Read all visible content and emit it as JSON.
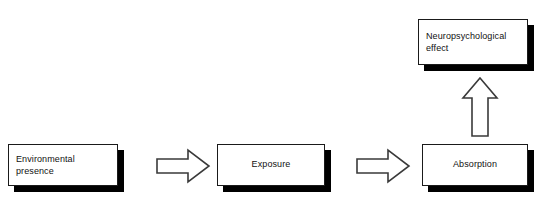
{
  "diagram": {
    "background_color": "#ffffff",
    "box_fill_color": "#ffffff",
    "box_border_color": "#1a1a1a",
    "box_shadow_color": "#000000",
    "arrow_fill_color": "#ffffff",
    "arrow_stroke_color": "#3a3a3a",
    "text_color": "#111111",
    "nodes": [
      {
        "id": "environmental-presence",
        "label": "Environmental\npresence",
        "line1": "Environmental",
        "line2": "presence",
        "align": "left"
      },
      {
        "id": "exposure",
        "label": "Exposure",
        "line1": "Exposure",
        "align": "center"
      },
      {
        "id": "absorption",
        "label": "Absorption",
        "line1": "Absorption",
        "align": "center"
      },
      {
        "id": "neuropsychological-effect",
        "label": "Neuropsychological\neffect",
        "line1": "Neuropsychological",
        "line2": "effect",
        "align": "left"
      }
    ],
    "connectors": [
      {
        "id": "arrow-presence-to-exposure",
        "icon": "arrow-right-block-icon",
        "direction": "right",
        "from": "environmental-presence",
        "to": "exposure"
      },
      {
        "id": "arrow-exposure-to-absorption",
        "icon": "arrow-right-block-icon",
        "direction": "right",
        "from": "exposure",
        "to": "absorption"
      },
      {
        "id": "arrow-absorption-to-effect",
        "icon": "arrow-up-block-icon",
        "direction": "up",
        "from": "absorption",
        "to": "neuropsychological-effect"
      }
    ]
  }
}
